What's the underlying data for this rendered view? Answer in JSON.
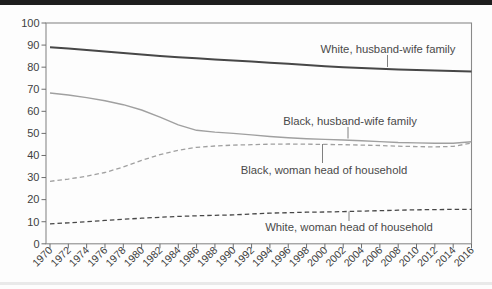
{
  "page": {
    "background_color": "#fdfdfd",
    "top_bar_color": "#1e1e1e",
    "bottom_smudge_color": "#d8d8d8"
  },
  "chart_data": {
    "type": "line",
    "title": "",
    "xlabel": "",
    "ylabel": "",
    "xlim": [
      1970,
      2016
    ],
    "ylim": [
      0,
      100
    ],
    "grid": false,
    "legend_position": "inline-annotations",
    "x": [
      1970,
      1972,
      1974,
      1976,
      1978,
      1980,
      1982,
      1984,
      1986,
      1988,
      1990,
      1992,
      1994,
      1996,
      1998,
      2000,
      2002,
      2004,
      2006,
      2008,
      2010,
      2012,
      2014,
      2016
    ],
    "x_tick_labels": [
      "1970",
      "1972",
      "1974",
      "1976",
      "1978",
      "1980",
      "1982",
      "1984",
      "1986",
      "1988",
      "1990",
      "1992",
      "1994",
      "1996",
      "1998",
      "2000",
      "2002",
      "2004",
      "2006",
      "2008",
      "2010",
      "2012",
      "2014",
      "2016"
    ],
    "y_ticks": [
      0,
      10,
      20,
      30,
      40,
      50,
      60,
      70,
      80,
      90,
      100
    ],
    "y_tick_labels": [
      "0",
      "10",
      "20",
      "30",
      "40",
      "50",
      "60",
      "70",
      "80",
      "90",
      "100"
    ],
    "series": [
      {
        "name": "White, husband-wife family",
        "style": "solid",
        "color": "#474747",
        "width": 2.0,
        "values": [
          89.0,
          88.4,
          87.8,
          87.1,
          86.4,
          85.7,
          85.1,
          84.5,
          84.0,
          83.5,
          83.0,
          82.5,
          82.0,
          81.5,
          81.0,
          80.4,
          80.0,
          79.6,
          79.3,
          79.0,
          78.7,
          78.5,
          78.3,
          78.0
        ]
      },
      {
        "name": "Black, husband-wife family",
        "style": "solid",
        "color": "#a0a0a0",
        "width": 1.4,
        "values": [
          68.3,
          67.4,
          66.2,
          64.8,
          63.0,
          60.6,
          57.4,
          53.9,
          51.4,
          50.6,
          50.0,
          49.3,
          48.6,
          48.0,
          47.6,
          47.3,
          47.0,
          46.7,
          46.3,
          45.9,
          45.7,
          45.5,
          45.5,
          46.2
        ]
      },
      {
        "name": "Black, woman head of household",
        "style": "dashed",
        "color": "#a0a0a0",
        "width": 1.3,
        "values": [
          28.3,
          29.3,
          30.6,
          32.3,
          34.8,
          37.8,
          40.4,
          42.4,
          43.7,
          44.3,
          44.7,
          44.9,
          45.1,
          45.2,
          45.1,
          45.0,
          44.9,
          44.7,
          44.5,
          44.2,
          44.0,
          43.9,
          44.1,
          45.6
        ]
      },
      {
        "name": "White, woman head of household",
        "style": "dashed",
        "color": "#474747",
        "width": 1.3,
        "values": [
          9.0,
          9.5,
          10.0,
          10.6,
          11.1,
          11.6,
          12.0,
          12.4,
          12.7,
          12.9,
          13.1,
          13.5,
          13.9,
          14.1,
          14.3,
          14.4,
          14.6,
          14.8,
          15.0,
          15.2,
          15.4,
          15.5,
          15.6,
          15.6
        ]
      }
    ],
    "annotations": [
      {
        "label": "White, husband-wife family",
        "text_x": 388,
        "text_y": 49,
        "leader": {
          "x": 387.5,
          "y1": 55,
          "y2": 67
        }
      },
      {
        "label": "Black, husband-wife family",
        "text_x": 350,
        "text_y": 121,
        "leader": {
          "x": 348,
          "y1": 127,
          "y2": 138.5
        }
      },
      {
        "label": "Black, woman head of household",
        "text_x": 324,
        "text_y": 170,
        "leader": {
          "x": 322.5,
          "y1": 144,
          "y2": 163
        }
      },
      {
        "label": "White, woman head of household",
        "text_x": 349,
        "text_y": 227.5,
        "leader": {
          "x": 349,
          "y1": 211.5,
          "y2": 221
        }
      }
    ],
    "colors": {
      "frame": "#8a8a8a",
      "tick": "#6e6e6e",
      "tick_label_text": "#3f3f3f",
      "annotation_text": "#4a4a4a",
      "leader_line": "#808080"
    }
  }
}
